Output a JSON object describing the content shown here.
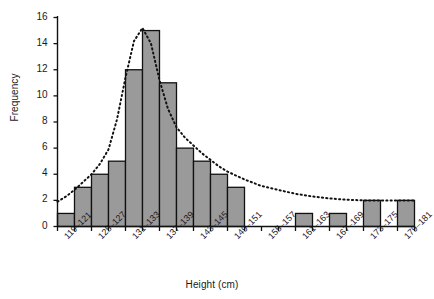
{
  "chart_data": {
    "type": "bar",
    "title": "",
    "subtitle": "",
    "xlabel": "Height (cm)",
    "ylabel": "Frequency",
    "categories": [
      "119–121",
      "122–124",
      "125–127",
      "128–130",
      "131–133",
      "134–136",
      "137–139",
      "140–142",
      "143–145",
      "146–148",
      "149–151",
      "152–154",
      "155–157",
      "158–160",
      "161–163",
      "164–166",
      "167–169",
      "170–172",
      "173–175",
      "176–178",
      "179–181"
    ],
    "values": [
      1,
      3,
      4,
      5,
      12,
      15,
      11,
      6,
      5,
      4,
      3,
      0,
      0,
      0,
      1,
      0,
      1,
      0,
      2,
      0,
      2
    ],
    "tick_labels_shown": [
      "119–121",
      "125–127",
      "131–133",
      "137–139",
      "143–145",
      "149–151",
      "155–157",
      "161–163",
      "167–169",
      "173–175",
      "179–181"
    ],
    "tick_label_indices": [
      0,
      2,
      4,
      6,
      8,
      10,
      12,
      14,
      16,
      18,
      20
    ],
    "ylim": [
      0,
      16
    ],
    "yticks": [
      0,
      2,
      4,
      6,
      8,
      10,
      12,
      14,
      16
    ],
    "ytick_labels": [
      "0",
      "2",
      "4",
      "6",
      "8",
      "10",
      "12",
      "14",
      "16"
    ],
    "grid": false,
    "legend": null,
    "legend_position": "none",
    "bar_fill_color": "#9a9a9a",
    "bar_edge_color": "#111111",
    "axis_color": "#111111",
    "overlay": {
      "name": "fitted-distribution-curve",
      "style": "dotted",
      "color": "#111111",
      "x": [
        0.0,
        0.5,
        1.0,
        1.5,
        2.0,
        2.5,
        3.0,
        3.5,
        4.0,
        4.5,
        5.0,
        5.5,
        6.0,
        6.5,
        7.0,
        7.5,
        8.0,
        8.5,
        9.0,
        9.5,
        10.0,
        11.0,
        12.0,
        13.0,
        14.0,
        15.0,
        16.0,
        17.0,
        18.0,
        19.0,
        20.0,
        21.0
      ],
      "y": [
        1.9,
        2.3,
        2.8,
        3.4,
        4.0,
        4.8,
        5.9,
        8.2,
        11.4,
        14.2,
        15.2,
        14.0,
        11.2,
        9.0,
        7.6,
        6.8,
        6.2,
        5.6,
        5.1,
        4.6,
        4.2,
        3.6,
        3.1,
        2.8,
        2.5,
        2.3,
        2.15,
        2.05,
        2.0,
        2.0,
        2.0,
        2.0
      ]
    }
  },
  "axes": {
    "y_axis_name": "frequency-axis",
    "x_axis_name": "height-axis"
  }
}
